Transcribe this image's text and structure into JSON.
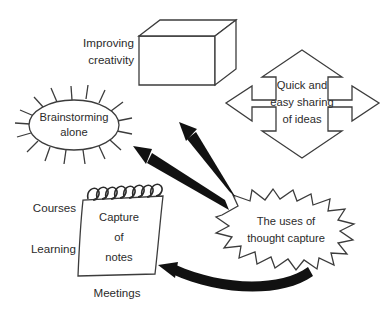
{
  "diagram": {
    "type": "concept-map",
    "background_color": "#ffffff",
    "outline_color": "#3c3c3c",
    "arrow_color": "#111111",
    "center": {
      "id": "uses-of-thought-capture",
      "shape": "starburst",
      "label_lines": [
        "The uses of",
        "thought capture"
      ]
    },
    "nodes": [
      {
        "id": "improving-creativity",
        "shape": "cube",
        "external_label_lines": [
          "Improving",
          "creativity"
        ]
      },
      {
        "id": "brainstorming-alone",
        "shape": "spiked-ellipse",
        "label_lines": [
          "Brainstorming",
          "alone"
        ]
      },
      {
        "id": "quick-easy-sharing",
        "shape": "four-way-arrow",
        "label_lines": [
          "Quick and",
          "easy sharing",
          "of ideas"
        ]
      },
      {
        "id": "capture-of-notes",
        "shape": "notepad",
        "label_lines": [
          "Capture",
          "of",
          "notes"
        ],
        "side_labels": [
          "Courses",
          "Learning",
          "Meetings"
        ]
      }
    ],
    "connectors": [
      {
        "id": "center-to-creativity",
        "style": "thick-straight-arrow",
        "from": "uses-of-thought-capture",
        "to": "improving-creativity"
      },
      {
        "id": "center-to-brainstorming",
        "style": "thick-straight-arrow",
        "from": "uses-of-thought-capture",
        "to": "brainstorming-alone"
      },
      {
        "id": "center-to-notes",
        "style": "thick-curved-arrow",
        "from": "uses-of-thought-capture",
        "to": "capture-of-notes"
      }
    ],
    "texts": {
      "improving": "Improving",
      "creativity": "creativity",
      "brainstorming": "Brainstorming",
      "alone": "alone",
      "quick_and": "Quick and",
      "easy_sharing": "easy sharing",
      "of_ideas": "of ideas",
      "capture": "Capture",
      "of": "of",
      "notes": "notes",
      "courses": "Courses",
      "learning": "Learning",
      "meetings": "Meetings",
      "the_uses_of": "The uses of",
      "thought_capture": "thought capture"
    }
  }
}
